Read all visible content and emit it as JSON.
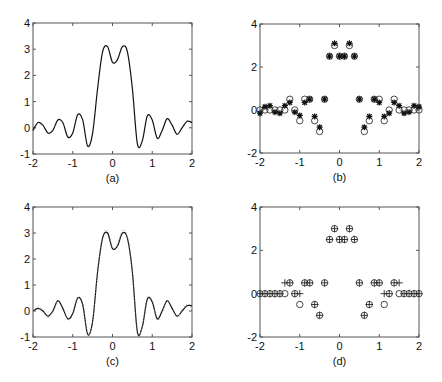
{
  "chart_data": [
    {
      "panel": "a",
      "type": "line",
      "caption": "(a)",
      "xlim": [
        -2,
        2
      ],
      "ylim": [
        -1,
        4
      ],
      "xticks": [
        "-2",
        "-1",
        "0",
        "1",
        "2"
      ],
      "yticks": [
        "-1",
        "0",
        "1",
        "2",
        "3",
        "4"
      ],
      "grid": false,
      "series": [
        {
          "name": "signal",
          "style": "solid",
          "x": [
            -2.0,
            -1.875,
            -1.75,
            -1.625,
            -1.5,
            -1.375,
            -1.25,
            -1.125,
            -1.0,
            -0.875,
            -0.75,
            -0.625,
            -0.5,
            -0.375,
            -0.25,
            -0.125,
            0.0,
            0.125,
            0.25,
            0.375,
            0.5,
            0.625,
            0.75,
            0.875,
            1.0,
            1.125,
            1.25,
            1.375,
            1.5,
            1.625,
            1.75,
            1.875,
            2.0
          ],
          "y": [
            -0.1,
            0.2,
            0.1,
            -0.2,
            -0.1,
            0.3,
            0.2,
            -0.35,
            -0.2,
            0.5,
            0.3,
            -0.7,
            -0.2,
            1.5,
            2.9,
            3.1,
            2.5,
            2.6,
            3.1,
            2.9,
            1.5,
            -0.6,
            -0.5,
            0.45,
            0.3,
            -0.4,
            -0.1,
            0.35,
            0.1,
            -0.25,
            0.0,
            0.25,
            0.2
          ]
        }
      ]
    },
    {
      "panel": "b",
      "type": "scatter",
      "caption": "(b)",
      "xlim": [
        -2,
        2
      ],
      "ylim": [
        -2,
        4
      ],
      "xticks": [
        "-2",
        "-1",
        "0",
        "1",
        "2"
      ],
      "yticks": [
        "-2",
        "0",
        "2",
        "4"
      ],
      "grid": false,
      "series": [
        {
          "name": "reference",
          "marker": "o",
          "x": [
            -2.0,
            -1.875,
            -1.75,
            -1.625,
            -1.5,
            -1.375,
            -1.25,
            -1.125,
            -1.0,
            -0.875,
            -0.75,
            -0.625,
            -0.5,
            -0.375,
            -0.25,
            -0.125,
            0.0,
            0.125,
            0.25,
            0.375,
            0.5,
            0.625,
            0.75,
            0.875,
            1.0,
            1.125,
            1.25,
            1.375,
            1.5,
            1.625,
            1.75,
            1.875,
            2.0
          ],
          "y": [
            0.0,
            0.0,
            0.0,
            0.0,
            0.0,
            0.0,
            0.5,
            0.0,
            -0.5,
            0.5,
            0.5,
            -0.5,
            -1.0,
            0.5,
            2.5,
            3.0,
            2.5,
            2.5,
            3.0,
            2.5,
            0.5,
            -1.0,
            -0.5,
            0.5,
            0.5,
            -0.5,
            0.0,
            0.5,
            0.0,
            0.0,
            0.0,
            0.0,
            0.0
          ]
        },
        {
          "name": "estimate",
          "marker": "*",
          "x": [
            -2.0,
            -1.875,
            -1.75,
            -1.625,
            -1.5,
            -1.375,
            -1.25,
            -1.125,
            -1.0,
            -0.875,
            -0.75,
            -0.625,
            -0.5,
            -0.375,
            -0.25,
            -0.125,
            0.0,
            0.125,
            0.25,
            0.375,
            0.5,
            0.625,
            0.75,
            0.875,
            1.0,
            1.125,
            1.25,
            1.375,
            1.5,
            1.625,
            1.75,
            1.875,
            2.0
          ],
          "y": [
            -0.15,
            0.15,
            0.2,
            -0.1,
            -0.15,
            0.2,
            0.35,
            -0.1,
            -0.25,
            0.35,
            0.5,
            -0.3,
            -0.8,
            0.5,
            2.5,
            3.1,
            2.5,
            2.5,
            3.1,
            2.5,
            0.5,
            -0.8,
            -0.3,
            0.5,
            0.35,
            -0.3,
            -0.15,
            0.35,
            0.2,
            -0.15,
            -0.1,
            0.2,
            0.15
          ]
        }
      ]
    },
    {
      "panel": "c",
      "type": "line",
      "caption": "(c)",
      "xlim": [
        -2,
        2
      ],
      "ylim": [
        -1,
        4
      ],
      "xticks": [
        "-2",
        "-1",
        "0",
        "1",
        "2"
      ],
      "yticks": [
        "-1",
        "0",
        "1",
        "2",
        "3",
        "4"
      ],
      "grid": false,
      "series": [
        {
          "name": "reconstruction",
          "style": "solid",
          "x": [
            -2.0,
            -1.875,
            -1.75,
            -1.625,
            -1.5,
            -1.375,
            -1.25,
            -1.125,
            -1.0,
            -0.875,
            -0.75,
            -0.625,
            -0.5,
            -0.375,
            -0.25,
            -0.125,
            0.0,
            0.125,
            0.25,
            0.375,
            0.5,
            0.625,
            0.75,
            0.875,
            1.0,
            1.125,
            1.25,
            1.375,
            1.5,
            1.625,
            1.75,
            1.875,
            2.0
          ],
          "y": [
            0.0,
            0.1,
            0.0,
            -0.2,
            0.0,
            0.4,
            0.1,
            -0.3,
            -0.1,
            0.5,
            0.25,
            -0.9,
            -0.4,
            1.5,
            2.8,
            3.0,
            2.4,
            2.5,
            3.0,
            2.8,
            1.5,
            -0.8,
            -0.6,
            0.45,
            0.35,
            -0.3,
            0.0,
            0.4,
            0.1,
            -0.2,
            0.0,
            0.2,
            0.2
          ]
        },
        {
          "name": "reference",
          "style": "dotted",
          "x": [
            -2.0,
            -1.875,
            -1.75,
            -1.625,
            -1.5,
            -1.375,
            -1.25,
            -1.125,
            -1.0,
            -0.875,
            -0.75,
            -0.625,
            -0.5,
            -0.375,
            -0.25,
            -0.125,
            0.0,
            0.125,
            0.25,
            0.375,
            0.5,
            0.625,
            0.75,
            0.875,
            1.0,
            1.125,
            1.25,
            1.375,
            1.5,
            1.625,
            1.75,
            1.875,
            2.0
          ],
          "y": [
            0.0,
            0.15,
            0.05,
            -0.25,
            -0.05,
            0.4,
            0.15,
            -0.35,
            -0.15,
            0.55,
            0.3,
            -0.9,
            -0.4,
            1.5,
            2.85,
            3.1,
            2.45,
            2.55,
            3.1,
            2.85,
            1.5,
            -0.8,
            -0.6,
            0.5,
            0.4,
            -0.35,
            -0.05,
            0.4,
            0.15,
            -0.25,
            0.05,
            0.25,
            0.2
          ]
        }
      ]
    },
    {
      "panel": "d",
      "type": "scatter",
      "caption": "(d)",
      "xlim": [
        -2,
        2
      ],
      "ylim": [
        -2,
        4
      ],
      "xticks": [
        "-2",
        "-1",
        "0",
        "1",
        "2"
      ],
      "yticks": [
        "-2",
        "0",
        "2",
        "4"
      ],
      "grid": false,
      "series": [
        {
          "name": "reference",
          "marker": "o",
          "x": [
            -2.0,
            -1.875,
            -1.75,
            -1.625,
            -1.5,
            -1.375,
            -1.25,
            -1.125,
            -1.0,
            -0.875,
            -0.75,
            -0.625,
            -0.5,
            -0.375,
            -0.25,
            -0.125,
            0.0,
            0.125,
            0.25,
            0.375,
            0.5,
            0.625,
            0.75,
            0.875,
            1.0,
            1.125,
            1.25,
            1.375,
            1.5,
            1.625,
            1.75,
            1.875,
            2.0
          ],
          "y": [
            0,
            0,
            0,
            0,
            0,
            0,
            0.5,
            0,
            -0.5,
            0.5,
            0.5,
            -0.5,
            -1,
            0.5,
            2.5,
            3,
            2.5,
            2.5,
            3,
            2.5,
            0.5,
            -1,
            -0.5,
            0.5,
            0.5,
            -0.5,
            0,
            0.5,
            0,
            0,
            0,
            0,
            0
          ]
        },
        {
          "name": "quantized",
          "marker": "+",
          "x": [
            -2.0,
            -1.875,
            -1.75,
            -1.625,
            -1.5,
            -1.375,
            -1.25,
            -1.125,
            -1.0,
            -0.875,
            -0.75,
            -0.625,
            -0.5,
            -0.375,
            -0.25,
            -0.125,
            0.0,
            0.125,
            0.25,
            0.375,
            0.5,
            0.625,
            0.75,
            0.875,
            1.0,
            1.125,
            1.25,
            1.375,
            1.5,
            1.625,
            1.75,
            1.875,
            2.0
          ],
          "y": [
            0,
            0,
            0,
            0,
            0,
            0.5,
            0.5,
            0,
            0,
            0.5,
            0.5,
            -0.5,
            -1,
            0.5,
            2.5,
            3,
            2.5,
            2.5,
            3,
            2.5,
            0.5,
            -1,
            -0.5,
            0.5,
            0.5,
            0,
            0,
            0.5,
            0.5,
            0,
            0,
            0,
            0
          ]
        }
      ]
    }
  ]
}
